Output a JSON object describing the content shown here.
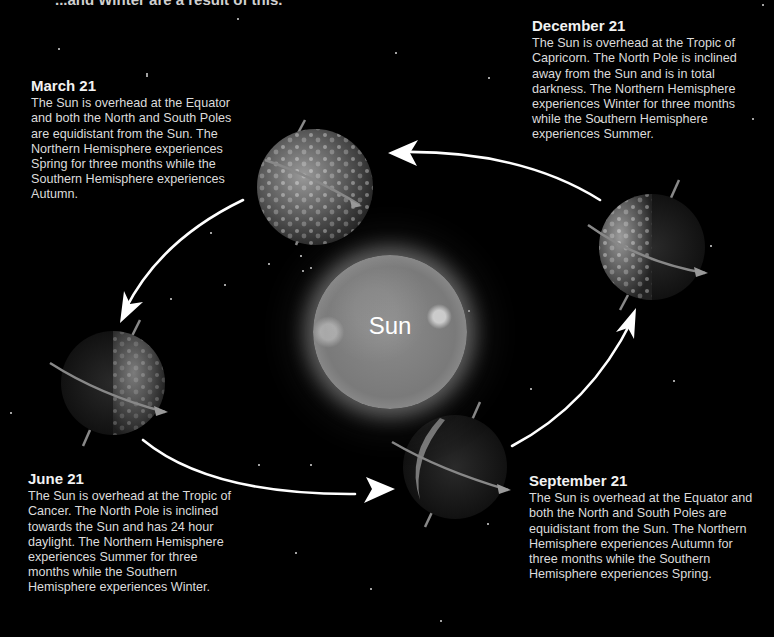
{
  "header": {
    "cut_off_caption": "...and Winter are a result of this."
  },
  "sun": {
    "label": "Sun"
  },
  "seasons": [
    {
      "id": "march",
      "date": "March 21",
      "description": "The Sun is overhead at the Equator and both the North and South Poles are equidistant from the Sun. The Northern Hemisphere experiences Spring for three months while the Southern Hemisphere experiences Autumn."
    },
    {
      "id": "june",
      "date": "June 21",
      "description": "The Sun is overhead at the Tropic of Cancer. The North Pole is inclined towards the Sun and has 24 hour daylight. The Northern Hemisphere experiences Summer for three months while the Southern Hemisphere experiences Winter."
    },
    {
      "id": "september",
      "date": "September 21",
      "description": "The Sun is overhead at the Equator and both the North and South Poles are equidistant from the Sun. The Northern Hemisphere experiences Autumn for three months while the Southern Hemisphere experiences Spring."
    },
    {
      "id": "december",
      "date": "December 21",
      "description": "The Sun is overhead at the Tropic of Capricorn. The North Pole is inclined away from the Sun and is in total darkness. The Northern Hemisphere experiences Winter for three months while the Southern Hemisphere experiences Summer."
    }
  ],
  "orbit": {
    "direction": "counter-clockwise",
    "arrow_color": "#ffffff"
  },
  "colors": {
    "background": "#000000",
    "text": "#e0e0e0",
    "heading": "#f2f2f2",
    "sun": "#808080"
  }
}
